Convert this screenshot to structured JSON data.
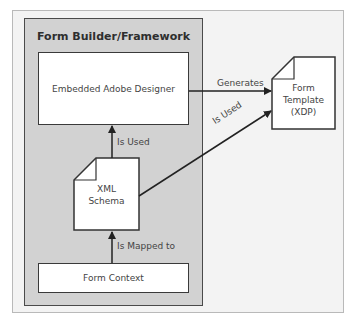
{
  "diagram": {
    "container": {
      "title": "Form Builder/Framework"
    },
    "nodes": {
      "designer": {
        "label": "Embedded Adobe Designer"
      },
      "schema": {
        "line1": "XML",
        "line2": "Schema"
      },
      "context": {
        "label": "Form Context"
      },
      "template": {
        "line1": "Form",
        "line2": "Template",
        "line3": "(XDP)"
      }
    },
    "edges": {
      "schema_to_designer": "Is Used",
      "context_to_schema": "Is Mapped to",
      "designer_to_template": "Generates",
      "schema_to_template": "Is Used"
    },
    "colors": {
      "panel_fill": "#d2d2d2",
      "frame_fill": "#f3f3f3",
      "stroke": "#333333"
    }
  }
}
